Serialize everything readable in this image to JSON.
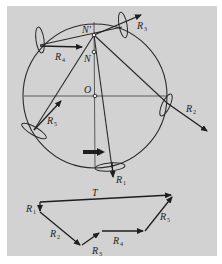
{
  "figure": {
    "background": "#d2d2d2",
    "ink": "#1e1e1e",
    "circle_labels": {
      "top_point": "N'",
      "inner_point": "N",
      "center": "O"
    },
    "rotor_forces": [
      {
        "id": "R1",
        "letter": "R",
        "sub": "1"
      },
      {
        "id": "R2",
        "letter": "R",
        "sub": "2"
      },
      {
        "id": "R3",
        "letter": "R",
        "sub": "3"
      },
      {
        "id": "R4",
        "letter": "R",
        "sub": "4"
      },
      {
        "id": "R5",
        "letter": "R",
        "sub": "5"
      }
    ],
    "polygon": {
      "resultant": "T",
      "vectors": [
        {
          "id": "R1",
          "letter": "R",
          "sub": "1"
        },
        {
          "id": "R2",
          "letter": "R",
          "sub": "2"
        },
        {
          "id": "R3",
          "letter": "R",
          "sub": "3"
        },
        {
          "id": "R4",
          "letter": "R",
          "sub": "4"
        },
        {
          "id": "R5",
          "letter": "R",
          "sub": "5"
        }
      ]
    }
  }
}
